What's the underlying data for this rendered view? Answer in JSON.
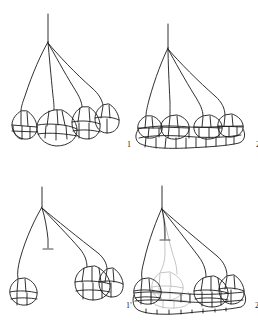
{
  "plate": {
    "background_color": "#ffffff",
    "ink_color": "#1a1a1a",
    "faded_ink_color": "#b9b9b9",
    "type": "line-drawing-plate",
    "panel_count": 4
  },
  "panels": [
    {
      "id": "panel-1",
      "caption": "1",
      "description": "branched axis with four terminal cell clusters",
      "branch_count": 4,
      "cluster_count": 4,
      "aborted_branch": false,
      "faded_cells": false
    },
    {
      "id": "panel-2",
      "caption": "2",
      "description": "branched axis with fused continuous basal band of cells",
      "branch_count": 4,
      "cluster_count": 4,
      "aborted_branch": false,
      "faded_cells": false
    },
    {
      "id": "panel-1p",
      "caption": "1'",
      "description": "branched axis with one aborted median branch and three terminal clusters",
      "branch_count": 4,
      "cluster_count": 3,
      "aborted_branch": true,
      "faded_cells": false
    },
    {
      "id": "panel-2p",
      "caption": "2'",
      "description": "branched axis with aborted median branch and faded reduced cell group within basal band",
      "branch_count": 4,
      "cluster_count": 4,
      "aborted_branch": true,
      "faded_cells": true
    }
  ],
  "captions": {
    "one": "1",
    "two": "2",
    "one_prime": "1'",
    "two_prime": "2'"
  }
}
